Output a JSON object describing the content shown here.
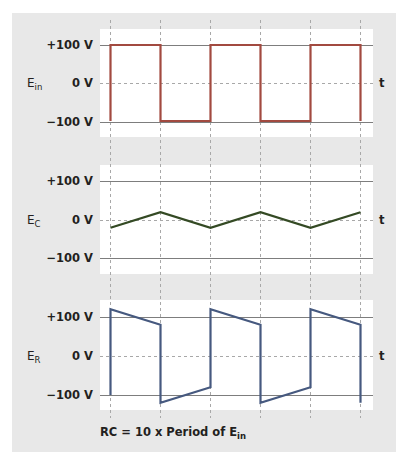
{
  "colors": {
    "panel_bg": "#e8e8e8",
    "plot_bg": "#ffffff",
    "axis_line": "#7d7d7d",
    "grid_dash": "#a8a8a8",
    "ein_color": "#a24a40",
    "ec_color": "#344a24",
    "er_color": "#46597f"
  },
  "caption": {
    "prefix": "RC = 10 x Period of E",
    "subscript": "in"
  },
  "axis": {
    "time_label": "t",
    "ticks": [
      "+100 V",
      "0 V",
      "−100 V"
    ]
  },
  "plots": [
    {
      "symbol": "E",
      "subscript": "in"
    },
    {
      "symbol": "E",
      "subscript": "C"
    },
    {
      "symbol": "E",
      "subscript": "R"
    }
  ],
  "chart_data": [
    {
      "type": "line",
      "title": "E_in (input square wave)",
      "ylabel": "E_in",
      "xlabel": "t",
      "ylim": [
        -100,
        100
      ],
      "yticks": [
        "+100 V",
        "0 V",
        "-100 V"
      ],
      "x": [
        0,
        0,
        1,
        1,
        2,
        2,
        3,
        3,
        4,
        4,
        5,
        5
      ],
      "values": [
        -100,
        100,
        100,
        -100,
        -100,
        100,
        100,
        -100,
        -100,
        100,
        100,
        -100
      ],
      "note": "x in half-periods"
    },
    {
      "type": "line",
      "title": "E_C (capacitor voltage)",
      "ylabel": "E_C",
      "xlabel": "t",
      "ylim": [
        -100,
        100
      ],
      "yticks": [
        "+100 V",
        "0 V",
        "-100 V"
      ],
      "x": [
        0,
        1,
        2,
        3,
        4,
        5
      ],
      "values": [
        -20,
        20,
        -20,
        20,
        -20,
        20
      ]
    },
    {
      "type": "line",
      "title": "E_R (resistor voltage)",
      "ylabel": "E_R",
      "xlabel": "t",
      "ylim": [
        -100,
        100
      ],
      "yticks": [
        "+100 V",
        "0 V",
        "-100 V"
      ],
      "x": [
        0,
        0,
        1,
        1,
        2,
        2,
        3,
        3,
        4,
        4,
        5,
        5
      ],
      "values": [
        -100,
        120,
        80,
        -120,
        -80,
        120,
        80,
        -120,
        -80,
        120,
        80,
        -120
      ]
    }
  ]
}
